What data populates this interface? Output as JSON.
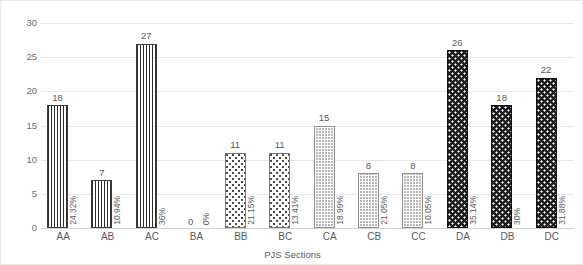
{
  "chart_data": {
    "type": "bar",
    "title": "",
    "xlabel": "PJS Sections",
    "ylabel": "",
    "ylim": [
      0,
      30
    ],
    "ytick_step": 5,
    "yticks": [
      "0",
      "5",
      "10",
      "15",
      "20",
      "25",
      "30"
    ],
    "grid": true,
    "legend": "none",
    "categories": [
      "AA",
      "AB",
      "AC",
      "BA",
      "BB",
      "BC",
      "CA",
      "CB",
      "CC",
      "DA",
      "DB",
      "DC"
    ],
    "values": [
      18,
      7,
      27,
      0,
      11,
      11,
      15,
      8,
      8,
      26,
      18,
      22
    ],
    "value_labels": [
      "18",
      "7",
      "27",
      "0",
      "11",
      "11",
      "15",
      "8",
      "8",
      "26",
      "18",
      "22"
    ],
    "percent_labels": [
      "24.32%",
      "10.94%",
      "36%",
      "0%",
      "21.15%",
      "13.41%",
      "18.99%",
      "21.05%",
      "10.05%",
      "35.14%",
      "30%",
      "31.88%"
    ],
    "groups": [
      "A",
      "A",
      "A",
      "B",
      "B",
      "B",
      "C",
      "C",
      "C",
      "D",
      "D",
      "D"
    ],
    "pattern_by_group": {
      "A": "fine-vertical-dotted",
      "B": "sparse-dot",
      "C": "gray-checker",
      "D": "dark-cross-dot"
    },
    "colors": {
      "gridline": "#e6e6e6",
      "axis": "#d0d0d0",
      "tick_text": "#5a5a5a",
      "background": "#ffffff",
      "group_a_fill": "#2e2e2e",
      "group_b_fill": "#4a4a4a",
      "group_c_fill": "#b5b5b5",
      "group_d_fill": "#1c1c1c"
    }
  }
}
